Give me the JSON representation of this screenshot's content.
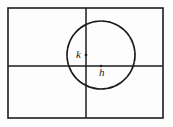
{
  "figure": {
    "canvas": {
      "width": 173,
      "height": 127,
      "background_color": "#fdfdfd"
    },
    "stroke_color": "#1c1c1c",
    "frame": {
      "name": "outer-border",
      "x": 8,
      "y": 8,
      "width": 155,
      "height": 110,
      "stroke_width": 1.6
    },
    "axes": {
      "x_axis": {
        "label": "",
        "y": 66,
        "x_start": 8,
        "x_end": 163,
        "stroke_width": 1.5
      },
      "y_axis": {
        "label": "",
        "x": 86,
        "y_start": 8,
        "y_end": 118,
        "stroke_width": 1.5
      }
    },
    "circle": {
      "name": "circle",
      "center_x": 101,
      "center_y": 55,
      "radius": 34,
      "stroke_width": 1.7,
      "style": "rough-sketch"
    },
    "labels": [
      {
        "id": "k",
        "text": "k",
        "x": 76,
        "y": 58,
        "marker_x": 86,
        "marker_y": 55,
        "description": "vertical offset label on y-axis"
      },
      {
        "id": "h",
        "text": "h",
        "x": 99,
        "y": 76,
        "marker_x": 101,
        "marker_y": 66,
        "description": "horizontal offset label on x-axis"
      }
    ]
  }
}
